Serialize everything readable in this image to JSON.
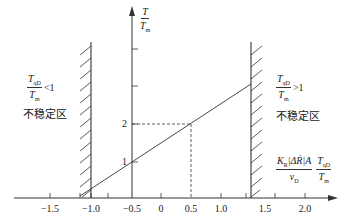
{
  "diagram": {
    "type": "stability-region-plot",
    "y_axis": {
      "label_num": "T",
      "label_den": "T",
      "label_den_sub": "m",
      "ticks": [
        {
          "label": "1",
          "value": 1
        },
        {
          "label": "2",
          "value": 2
        }
      ]
    },
    "x_axis": {
      "label_frac1_num": "K",
      "label_frac1_num_sub": "R",
      "label_frac1_num_rest": "|ΔṘ|A",
      "label_frac1_den": "v",
      "label_frac1_den_sub": "D",
      "label_frac2_num": "T",
      "label_frac2_num_sub": "qD",
      "label_frac2_den": "T",
      "label_frac2_den_sub": "m",
      "ticks": [
        {
          "label": "−1.5",
          "value": -1.5
        },
        {
          "label": "−1.0",
          "value": -1.0
        },
        {
          "label": "−0.5",
          "value": -0.5
        },
        {
          "label": "0",
          "value": 0
        },
        {
          "label": "0.5",
          "value": 0.5
        },
        {
          "label": "1.0",
          "value": 1.0
        },
        {
          "label": "1.5",
          "value": 1.5
        },
        {
          "label": "2.0",
          "value": 2.0
        }
      ]
    },
    "left_region": {
      "condition_num": "T",
      "condition_num_sub": "qD",
      "condition_den": "T",
      "condition_den_sub": "m",
      "condition_rel": "<1",
      "label": "不稳定区"
    },
    "right_region": {
      "condition_num": "T",
      "condition_num_sub": "qD",
      "condition_den": "T",
      "condition_den_sub": "m",
      "condition_rel": ">1",
      "label": "不稳定区"
    },
    "reference_point": {
      "x": 0.5,
      "y": 2
    },
    "colors": {
      "line": "#333333",
      "background": "#ffffff"
    }
  }
}
